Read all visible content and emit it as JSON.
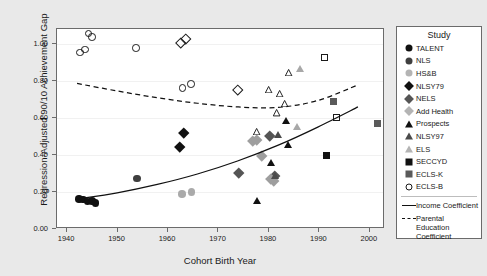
{
  "chart_data": {
    "type": "scatter",
    "title": "",
    "xlabel": "Cohort Birth Year",
    "ylabel": "Regression-Adjusted 90/10 Achievement Gap",
    "xlim": [
      1938,
      2003
    ],
    "ylim": [
      0.0,
      1.08
    ],
    "xticks": [
      1940,
      1950,
      1960,
      1970,
      1980,
      1990,
      2000
    ],
    "xticklabels": [
      "1940",
      "1950",
      "1960",
      "1970",
      "1980",
      "1990",
      "2000"
    ],
    "yticks": [
      0.0,
      0.2,
      0.4,
      0.6,
      0.8,
      1.0
    ],
    "yticklabels": [
      "0.00",
      "0.20",
      "0.40",
      "0.60",
      "0.80",
      "1.00"
    ],
    "grid": true,
    "legend_position": "right-outside",
    "legend_title": "Study",
    "series": [
      {
        "name": "TALENT",
        "marker": "circle",
        "fill": "#111111",
        "edge": "#111111",
        "size": 7.5,
        "points": [
          {
            "x": 1942.4,
            "y": 0.163
          },
          {
            "x": 1943.2,
            "y": 0.158
          },
          {
            "x": 1944.0,
            "y": 0.148
          },
          {
            "x": 1944.9,
            "y": 0.152
          },
          {
            "x": 1945.6,
            "y": 0.14
          }
        ]
      },
      {
        "name": "NLS",
        "marker": "circle",
        "fill": "#3f3f3f",
        "edge": "#3f3f3f",
        "size": 7.5,
        "points": [
          {
            "x": 1953.9,
            "y": 0.272
          }
        ]
      },
      {
        "name": "HS&B",
        "marker": "circle",
        "fill": "#aaaaaa",
        "edge": "#aaaaaa",
        "size": 7.5,
        "points": [
          {
            "x": 1962.8,
            "y": 0.19
          },
          {
            "x": 1964.7,
            "y": 0.201
          }
        ]
      },
      {
        "name": "NLSY79",
        "marker": "diamond",
        "fill": "#111111",
        "edge": "#111111",
        "size": 7.5,
        "points": [
          {
            "x": 1962.3,
            "y": 0.446
          },
          {
            "x": 1963.1,
            "y": 0.52
          }
        ]
      },
      {
        "name": "NELS",
        "marker": "diamond",
        "fill": "#555555",
        "edge": "#555555",
        "size": 7.5,
        "points": [
          {
            "x": 1974.0,
            "y": 0.302
          },
          {
            "x": 1980.1,
            "y": 0.503
          },
          {
            "x": 1981.2,
            "y": 0.289
          }
        ]
      },
      {
        "name": "Add Health",
        "marker": "diamond",
        "fill": "#9e9e9e",
        "edge": "#9e9e9e",
        "size": 7.5,
        "points": [
          {
            "x": 1976.8,
            "y": 0.476
          },
          {
            "x": 1977.6,
            "y": 0.483
          },
          {
            "x": 1978.5,
            "y": 0.393
          },
          {
            "x": 1980.3,
            "y": 0.271
          },
          {
            "x": 1981.0,
            "y": 0.262
          }
        ]
      },
      {
        "name": "Prospects",
        "marker": "triangle",
        "fill": "#111111",
        "edge": "#111111",
        "size": 8,
        "points": [
          {
            "x": 1977.8,
            "y": 0.152
          },
          {
            "x": 1980.6,
            "y": 0.357
          },
          {
            "x": 1983.6,
            "y": 0.583
          },
          {
            "x": 1984.0,
            "y": 0.456
          }
        ]
      },
      {
        "name": "NLSY97",
        "marker": "triangle",
        "fill": "#4a4a4a",
        "edge": "#4a4a4a",
        "size": 8,
        "points": [
          {
            "x": 1981.4,
            "y": 0.286
          },
          {
            "x": 1982.0,
            "y": 0.509
          }
        ]
      },
      {
        "name": "ELS",
        "marker": "triangle",
        "fill": "#a8a8a8",
        "edge": "#a8a8a8",
        "size": 8,
        "points": [
          {
            "x": 1985.6,
            "y": 0.553
          },
          {
            "x": 1986.2,
            "y": 0.868
          }
        ]
      },
      {
        "name": "SECCYD",
        "marker": "square",
        "fill": "#111111",
        "edge": "#111111",
        "size": 7,
        "points": [
          {
            "x": 1991.4,
            "y": 0.398
          }
        ]
      },
      {
        "name": "ECLS-K",
        "marker": "square",
        "fill": "#5a5a5a",
        "edge": "#5a5a5a",
        "size": 7,
        "points": [
          {
            "x": 1992.8,
            "y": 0.689
          },
          {
            "x": 2001.6,
            "y": 0.571
          }
        ]
      },
      {
        "name": "ECLS-B",
        "marker": "circle-open",
        "fill": "none",
        "edge": "#1a1a1a",
        "size": 7.5,
        "points": [
          {
            "x": 1942.6,
            "y": 0.953
          },
          {
            "x": 1943.5,
            "y": 0.968
          },
          {
            "x": 1944.2,
            "y": 1.055
          },
          {
            "x": 1944.9,
            "y": 1.036
          },
          {
            "x": 1953.7,
            "y": 0.978
          },
          {
            "x": 1962.9,
            "y": 0.762
          },
          {
            "x": 1964.6,
            "y": 0.784
          }
        ]
      },
      {
        "name": "NLSY79-open",
        "marker": "diamond-open",
        "fill": "none",
        "edge": "#1a1a1a",
        "size": 7.5,
        "points": [
          {
            "x": 1962.5,
            "y": 1.005
          },
          {
            "x": 1963.5,
            "y": 1.028
          },
          {
            "x": 1973.8,
            "y": 0.754
          }
        ]
      },
      {
        "name": "Prospects-open",
        "marker": "triangle-open",
        "fill": "none",
        "edge": "#1a1a1a",
        "size": 8,
        "points": [
          {
            "x": 1977.6,
            "y": 0.562
          },
          {
            "x": 1980.0,
            "y": 0.789
          },
          {
            "x": 1981.7,
            "y": 0.663
          },
          {
            "x": 1982.2,
            "y": 0.766
          },
          {
            "x": 1983.2,
            "y": 0.714
          },
          {
            "x": 1984.1,
            "y": 0.881
          }
        ]
      },
      {
        "name": "SECCYD-open",
        "marker": "square-open",
        "fill": "none",
        "edge": "#1a1a1a",
        "size": 7,
        "points": [
          {
            "x": 1991.0,
            "y": 0.925
          },
          {
            "x": 1993.4,
            "y": 0.6
          }
        ]
      }
    ],
    "fits": [
      {
        "name": "Income Coefficient",
        "style": "solid",
        "color": "#111111",
        "points": [
          {
            "x": 1942.0,
            "y": 0.152
          },
          {
            "x": 1950.0,
            "y": 0.186
          },
          {
            "x": 1958.0,
            "y": 0.232
          },
          {
            "x": 1966.0,
            "y": 0.289
          },
          {
            "x": 1974.0,
            "y": 0.36
          },
          {
            "x": 1982.0,
            "y": 0.445
          },
          {
            "x": 1990.0,
            "y": 0.545
          },
          {
            "x": 1998.0,
            "y": 0.655
          }
        ]
      },
      {
        "name": "Parental Education Coefficient",
        "style": "dashed",
        "color": "#111111",
        "points": [
          {
            "x": 1942.0,
            "y": 0.783
          },
          {
            "x": 1950.0,
            "y": 0.742
          },
          {
            "x": 1958.0,
            "y": 0.705
          },
          {
            "x": 1966.0,
            "y": 0.675
          },
          {
            "x": 1974.0,
            "y": 0.655
          },
          {
            "x": 1982.0,
            "y": 0.652
          },
          {
            "x": 1990.0,
            "y": 0.69
          },
          {
            "x": 1998.0,
            "y": 0.775
          }
        ]
      }
    ]
  },
  "legend": {
    "title": "Study",
    "entries": [
      {
        "label": "TALENT",
        "marker": "circle",
        "fill": "#111111"
      },
      {
        "label": "NLS",
        "marker": "circle",
        "fill": "#3f3f3f"
      },
      {
        "label": "HS&B",
        "marker": "circle",
        "fill": "#b4b4b4"
      },
      {
        "label": "NLSY79",
        "marker": "diamond",
        "fill": "#111111"
      },
      {
        "label": "NELS",
        "marker": "diamond",
        "fill": "#555555"
      },
      {
        "label": "Add Health",
        "marker": "diamond",
        "fill": "#b4b4b4"
      },
      {
        "label": "Prospects",
        "marker": "triangle",
        "fill": "#111111"
      },
      {
        "label": "NLSY97",
        "marker": "triangle",
        "fill": "#4a4a4a"
      },
      {
        "label": "ELS",
        "marker": "triangle",
        "fill": "#b4b4b4"
      },
      {
        "label": "SECCYD",
        "marker": "square",
        "fill": "#111111"
      },
      {
        "label": "ECLS-K",
        "marker": "square",
        "fill": "#5a5a5a"
      },
      {
        "label": "ECLS-B",
        "marker": "circle-open",
        "fill": "none"
      }
    ],
    "lines": [
      {
        "label": "Income Coefficient",
        "style": "solid"
      },
      {
        "label": "Parental Education Coefficient",
        "style": "dashed"
      }
    ]
  }
}
